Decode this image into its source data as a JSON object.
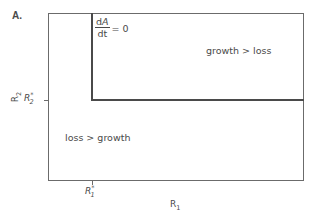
{
  "panel": {
    "label": "A."
  },
  "isocline": {
    "numerator": "dA",
    "numerator_d": "d",
    "numerator_var": "A",
    "denominator": "dt",
    "equals": "= 0"
  },
  "regions": {
    "upper_right": "growth > loss",
    "lower_left": "loss > growth"
  },
  "axes": {
    "x": {
      "label_base": "R",
      "label_sub": "1",
      "tick_base": "R",
      "tick_sub": "1",
      "tick_sup": "*"
    },
    "y": {
      "label_base": "R",
      "label_sub": "2",
      "tick_base": "R",
      "tick_sub": "2",
      "tick_sup": "*"
    }
  },
  "colors": {
    "frame": "#6b6b6b",
    "isocline": "#4a4a4a",
    "text": "#4a4a4a",
    "background": "#ffffff"
  }
}
